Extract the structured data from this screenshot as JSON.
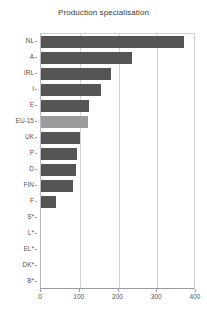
{
  "chart_data": {
    "type": "bar",
    "orientation": "horizontal",
    "title": "Production specialisation",
    "xlabel": "",
    "ylabel": "",
    "categories": [
      "NL",
      "A",
      "IRL",
      "I",
      "E",
      "EU-15",
      "UK",
      "P",
      "D",
      "FIN",
      "F",
      "S*",
      "L*",
      "EL*",
      "DK*",
      "B*"
    ],
    "values": [
      369,
      235,
      180,
      155,
      124,
      121,
      100,
      93,
      90,
      83,
      39,
      0,
      0,
      0,
      0,
      0
    ],
    "series": [
      {
        "name": "Production specialisation",
        "values": [
          369,
          235,
          180,
          155,
          124,
          121,
          100,
          93,
          90,
          83,
          39,
          0,
          0,
          0,
          0,
          0
        ]
      }
    ],
    "highlight_category": "EU-15",
    "xlim": [
      0,
      400
    ],
    "xticks": [
      0,
      100,
      200,
      300,
      400
    ],
    "xtick_labels": [
      "0",
      "100",
      "200",
      "300",
      "400"
    ],
    "gridlines": [
      100,
      200,
      300
    ],
    "grid": true,
    "legend": "none",
    "colors": {
      "bar": "#555555",
      "highlight_bar": "#9c9c9c",
      "grid": "#d2d2dc",
      "axis": "#9a9aa6",
      "text": "#555555",
      "title": "#3a3a3a",
      "background": "#ffffff"
    }
  }
}
